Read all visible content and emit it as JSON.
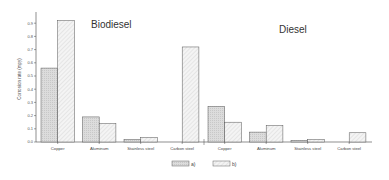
{
  "chart_data": {
    "type": "bar",
    "title": "",
    "xlabel": "",
    "ylabel": "Corrosion rate (mpy)",
    "ylim": [
      0,
      0.95
    ],
    "yticks": [
      "0.0",
      "0.1",
      "0.2",
      "0.3",
      "0.4",
      "0.5",
      "0.6",
      "0.7",
      "0.8",
      "0.9"
    ],
    "grid": false,
    "legend_position": "bottom-center",
    "groups": [
      {
        "title": "Biodiesel",
        "categories": [
          "Copper",
          "Aluminum",
          "Stainless steel",
          "Carbon steel"
        ],
        "series": [
          {
            "name": "a)",
            "values": [
              0.56,
              0.19,
              0.02,
              0.0
            ]
          },
          {
            "name": "b)",
            "values": [
              0.92,
              0.14,
              0.035,
              0.72
            ]
          }
        ]
      },
      {
        "title": "Diesel",
        "categories": [
          "Copper",
          "Aluminum",
          "Stainless steel",
          "Carbon steel"
        ],
        "series": [
          {
            "name": "a)",
            "values": [
              0.27,
              0.075,
              0.012,
              0.0
            ]
          },
          {
            "name": "b)",
            "values": [
              0.15,
              0.125,
              0.02,
              0.07
            ]
          }
        ]
      }
    ],
    "legend": [
      "a)",
      "b)"
    ],
    "colors": {
      "a": "#d9d9d9",
      "b": "#f2f2f2",
      "edge": "#555555"
    }
  }
}
